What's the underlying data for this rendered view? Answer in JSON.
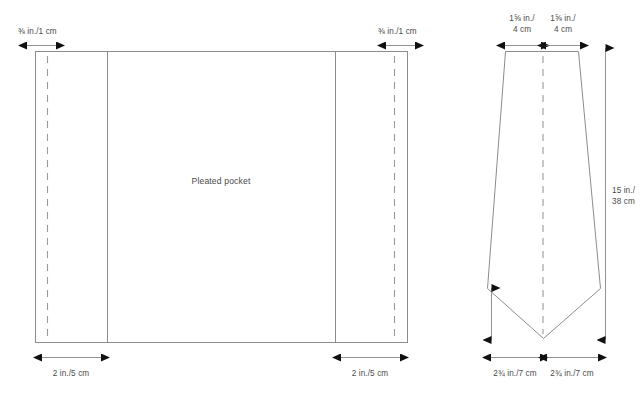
{
  "diagram": {
    "colors": {
      "outline": "#8c8c8c",
      "dashed": "#9a9a9a",
      "arrow": "#1a1a1a",
      "text": "#4a4a4a",
      "background": "#ffffff"
    }
  },
  "pocket_piece": {
    "label": "Pleated pocket",
    "top_left_dimension": "⅜ in./1 cm",
    "top_right_dimension": "⅜ in./1 cm",
    "bottom_left_dimension": "2 in./5 cm",
    "bottom_right_dimension": "2 in./5 cm"
  },
  "tie_piece": {
    "top_left_dimension_line1": "1⅝ in./",
    "top_left_dimension_line2": "4 cm",
    "top_right_dimension_line1": "1⅝ in./",
    "top_right_dimension_line2": "4 cm",
    "height_dimension_line1": "15 in./",
    "height_dimension_line2": "38 cm",
    "bottom_left_dimension": "2¾ in./7 cm",
    "bottom_right_dimension": "2¾ in./7 cm"
  }
}
